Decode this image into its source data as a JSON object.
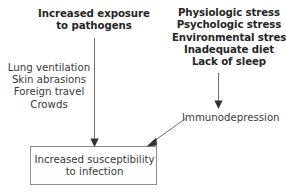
{
  "diagram": {
    "title_visible": false,
    "nodes": {
      "exposure_heading": "Increased exposure\nto pathogens",
      "exposure_routes": "Lung ventilation\nSkin abrasions\nForeign travel\nCrowds",
      "stressors": "Physiologic stress\nPsychologic stress\nEnvironmental stress\nInadequate diet\nLack of sleep",
      "immunodepression": "Immunodepression",
      "outcome": "Increased susceptibility\nto infection"
    },
    "edges": [
      {
        "name": "exposure-to-outcome",
        "from": "exposure_heading",
        "to": "outcome",
        "style": "straight-down-arrow"
      },
      {
        "name": "stressors-to-immunodepression",
        "from": "stressors",
        "to": "immunodepression",
        "style": "straight-down-arrow"
      },
      {
        "name": "immunodepression-to-outcome",
        "from": "immunodepression",
        "to": "outcome",
        "style": "diagonal-down-left-arrow"
      }
    ],
    "colors": {
      "text": "#2b2b2b",
      "secondary_text": "#3a3a3a",
      "arrow": "#6f6f6f",
      "box_border": "#8d8d8d",
      "box_fill": "#fefefe",
      "background": "#ffffff"
    }
  }
}
